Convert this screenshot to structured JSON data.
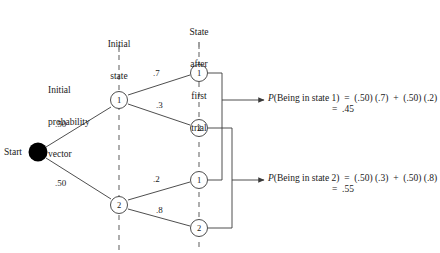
{
  "figure": {
    "column_headers": [
      {
        "id": "initial-state",
        "lines": [
          "Initial",
          "state"
        ]
      },
      {
        "id": "state-after-first-trial",
        "lines": [
          "State",
          "after",
          "first",
          "trial"
        ]
      }
    ],
    "side_label": {
      "id": "initial-probability-vector",
      "lines": [
        "Initial",
        "probability",
        "vector"
      ]
    },
    "start_label": "Start",
    "nodes": {
      "start": "",
      "initial_state_1": "1",
      "initial_state_2": "2",
      "trial_1_top": "1",
      "trial_2_top": "2",
      "trial_1_bottom": "1",
      "trial_2_bottom": "2"
    },
    "edge_labels": {
      "start_to_state1": ".50",
      "start_to_state2": ".50",
      "state1_to_1": ".7",
      "state1_to_2": ".3",
      "state2_to_1": ".2",
      "state2_to_2": ".8"
    },
    "equations": [
      {
        "id": "p-state-1",
        "prefix": "P",
        "line1": "(Being in state 1)  =  (.50) (.7)  +  (.50) (.2)",
        "line2": "=  .45"
      },
      {
        "id": "p-state-2",
        "prefix": "P",
        "line1": "(Being in state 2)  =  (.50) (.3)  +  (.50) (.8)",
        "line2": "=  .55"
      }
    ],
    "colors": {
      "line": "#3a3a3a",
      "node_fill": "#ffffff",
      "start_fill": "#000000",
      "text": "#1a1a1a"
    }
  }
}
